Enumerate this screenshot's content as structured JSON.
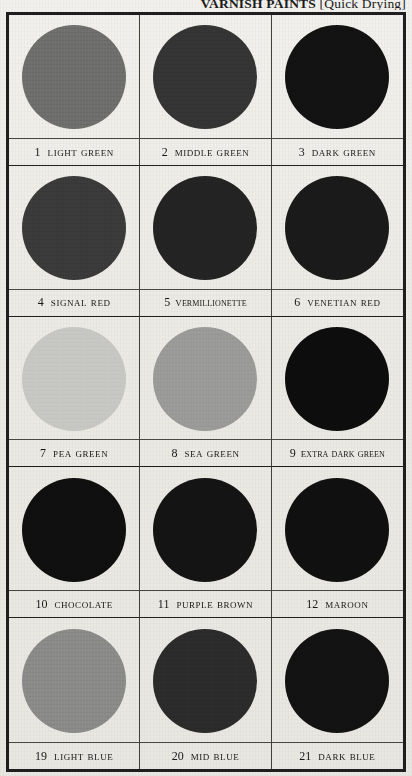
{
  "page": {
    "title_main": "VARNISH PAINTS",
    "title_bracket": "[Quick Drying]",
    "title_full": "VARNISH PAINTS [Quick Drying]",
    "paper_color": "#efeeea",
    "border_color": "#1f1f1f",
    "text_color": "#181818"
  },
  "swatches": [
    {
      "number": "1",
      "name": "Light Green",
      "color": "#6e6f6c",
      "compact": false
    },
    {
      "number": "2",
      "name": "Middle Green",
      "color": "#343434",
      "compact": false
    },
    {
      "number": "3",
      "name": "Dark Green",
      "color": "#121212",
      "compact": false
    },
    {
      "number": "4",
      "name": "Signal Red",
      "color": "#3a3a3a",
      "compact": false
    },
    {
      "number": "5",
      "name": "Vermillionette",
      "color": "#232323",
      "compact": true
    },
    {
      "number": "6",
      "name": "Venetian Red",
      "color": "#1a1a1a",
      "compact": false
    },
    {
      "number": "7",
      "name": "Pea Green",
      "color": "#c6c6c3",
      "compact": false
    },
    {
      "number": "8",
      "name": "Sea Green",
      "color": "#9a9a98",
      "compact": false
    },
    {
      "number": "9",
      "name": "Extra Dark Green",
      "color": "#0d0d0d",
      "compact": true
    },
    {
      "number": "10",
      "name": "Chocolate",
      "color": "#0f0f0f",
      "compact": false
    },
    {
      "number": "11",
      "name": "Purple Brown",
      "color": "#141414",
      "compact": false
    },
    {
      "number": "12",
      "name": "Maroon",
      "color": "#101010",
      "compact": false
    },
    {
      "number": "19",
      "name": "Light Blue",
      "color": "#8a8b89",
      "compact": false
    },
    {
      "number": "20",
      "name": "Mid Blue",
      "color": "#2b2b2b",
      "compact": false
    },
    {
      "number": "21",
      "name": "Dark Blue",
      "color": "#121212",
      "compact": false
    }
  ]
}
